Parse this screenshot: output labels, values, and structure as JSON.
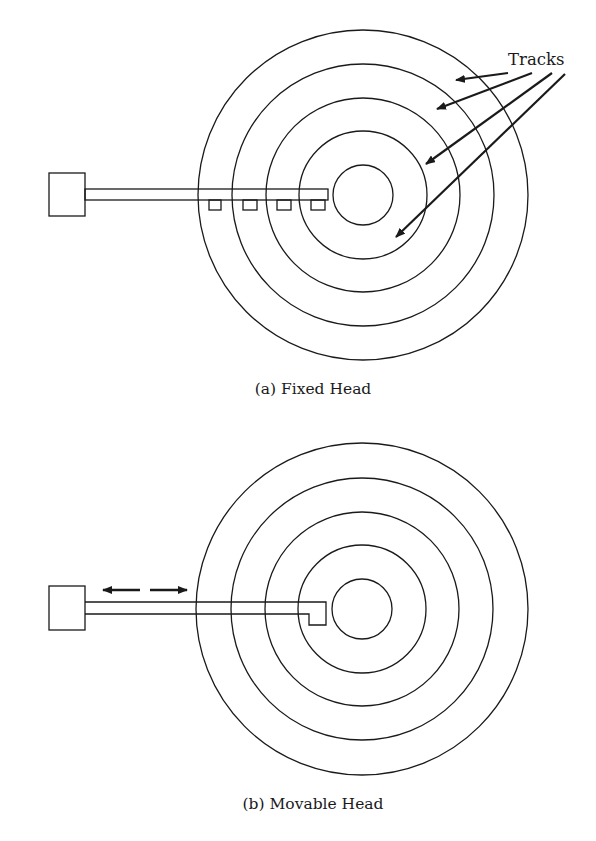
{
  "figure": {
    "panels": [
      {
        "id": "a",
        "caption": "(a) Fixed Head",
        "disk": {
          "cx": 363,
          "cy": 195,
          "radii": [
            30,
            64,
            97,
            131,
            165
          ]
        },
        "actuator_box": {
          "x": 49,
          "y": 173,
          "w": 36,
          "h": 43
        },
        "arm": {
          "x1": 85,
          "x2": 328,
          "y_top": 189,
          "y_bottom": 200
        },
        "heads": [
          {
            "x": 209,
            "w": 12
          },
          {
            "x": 243,
            "w": 14
          },
          {
            "x": 277,
            "w": 14
          },
          {
            "x": 311,
            "w": 14
          }
        ],
        "label": {
          "text": "Tracks",
          "arrows": [
            {
              "x1": 508,
              "y1": 73,
              "x2": 456,
              "y2": 80
            },
            {
              "x1": 532,
              "y1": 73,
              "x2": 437,
              "y2": 109
            },
            {
              "x1": 552,
              "y1": 73,
              "x2": 426,
              "y2": 164
            },
            {
              "x1": 565,
              "y1": 74,
              "x2": 396,
              "y2": 237
            }
          ]
        }
      },
      {
        "id": "b",
        "caption": "(b) Movable Head",
        "disk": {
          "cx": 362,
          "cy": 609,
          "radii": [
            30,
            64,
            97,
            131,
            166
          ]
        },
        "actuator_box": {
          "x": 49,
          "y": 586,
          "w": 36,
          "h": 44
        },
        "arm": {
          "x1": 85,
          "x2": 326,
          "y_top": 602,
          "y_bottom": 614
        },
        "head": {
          "x": 309,
          "y_bottom": 625
        },
        "motion_arrows": [
          {
            "x1": 140,
            "y1": 590,
            "x2": 103,
            "y2": 590
          },
          {
            "x1": 150,
            "y1": 590,
            "x2": 187,
            "y2": 590
          }
        ]
      }
    ]
  },
  "colors": {
    "stroke": "#1a1a1a",
    "background": "#ffffff"
  }
}
